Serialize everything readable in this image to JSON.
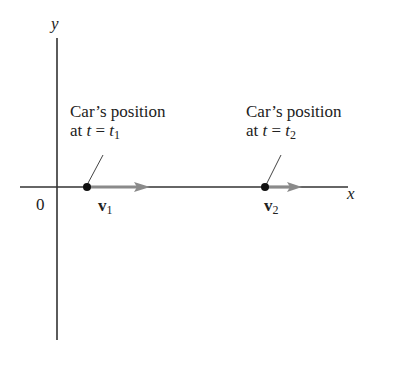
{
  "diagram": {
    "axes": {
      "x_label": "x",
      "y_label": "y",
      "origin_label": "0"
    },
    "points": [
      {
        "annotation_line1": "Car’s position",
        "annotation_line2_prefix": "at ",
        "annotation_var": "t",
        "annotation_eq": " = ",
        "annotation_rhs": "t",
        "annotation_sub": "1",
        "vector_label": "v",
        "vector_sub": "1"
      },
      {
        "annotation_line1": "Car’s position",
        "annotation_line2_prefix": "at ",
        "annotation_var": "t",
        "annotation_eq": " = ",
        "annotation_rhs": "t",
        "annotation_sub": "2",
        "vector_label": "v",
        "vector_sub": "2"
      }
    ],
    "colors": {
      "axis": "#333333",
      "vector": "#8a8a8a",
      "point": "#111111"
    }
  }
}
